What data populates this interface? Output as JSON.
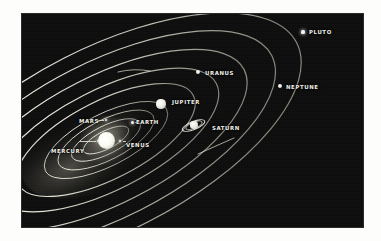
{
  "figure": {
    "kind": "solar-system-diagram",
    "caption": "",
    "background_color": "#0c0c0c",
    "page_color": "#fdfdfc",
    "label_color": "#efefe8",
    "orbit_color": "#e8e8dc",
    "plate": {
      "x": 22,
      "y": 14,
      "width": 341,
      "height": 213
    }
  },
  "sun": {
    "label": "",
    "cx": 84,
    "cy": 126,
    "r": 8.5,
    "glow_r": 26
  },
  "planets": [
    {
      "name": "MERCURY",
      "label": "MERCURY",
      "label_x": 29,
      "label_y": 135,
      "dot_x": 76,
      "dot_y": 127,
      "dot_r": 1.2,
      "orbit": {
        "rx": 25,
        "ry": 9,
        "rot": -27,
        "cx": 84,
        "cy": 126
      },
      "leader": true
    },
    {
      "name": "VENUS",
      "label": "VENUS",
      "label_x": 104,
      "label_y": 129,
      "dot_x": 98,
      "dot_y": 127,
      "dot_r": 1.4,
      "orbit": {
        "rx": 38,
        "ry": 14,
        "rot": -27,
        "cx": 84,
        "cy": 126
      },
      "leader": true
    },
    {
      "name": "EARTH",
      "label": "EARTH",
      "label_x": 114,
      "label_y": 106,
      "dot_x": 110,
      "dot_y": 108,
      "dot_r": 1.5,
      "orbit": {
        "rx": 53,
        "ry": 20,
        "rot": -27,
        "cx": 84,
        "cy": 126
      },
      "leader": true
    },
    {
      "name": "MARS",
      "label": "MARS",
      "label_x": 57,
      "label_y": 105,
      "dot_x": 84,
      "dot_y": 106,
      "dot_r": 1.3,
      "orbit": {
        "rx": 68,
        "ry": 26,
        "rot": -27,
        "cx": 84,
        "cy": 126
      },
      "leader": true
    },
    {
      "name": "JUPITER",
      "label": "JUPITER",
      "label_x": 150,
      "label_y": 86,
      "dot_x": 139,
      "dot_y": 90,
      "dot_r": 4.6,
      "orbit": {
        "rx": 98,
        "ry": 39,
        "rot": -27,
        "cx": 84,
        "cy": 126
      },
      "leader": false
    },
    {
      "name": "SATURN",
      "label": "SATURN",
      "label_x": 190,
      "label_y": 112,
      "dot_x": 172,
      "dot_y": 111,
      "dot_r": 3.6,
      "orbit": {
        "rx": 124,
        "ry": 50,
        "rot": -27,
        "cx": 84,
        "cy": 126
      },
      "leader": false,
      "has_rings": true
    },
    {
      "name": "URANUS",
      "label": "URANUS",
      "label_x": 183,
      "label_y": 57,
      "dot_x": 176,
      "dot_y": 58,
      "dot_r": 2.4,
      "orbit": {
        "rx": 155,
        "ry": 64,
        "rot": -27,
        "cx": 84,
        "cy": 126
      },
      "leader": false
    },
    {
      "name": "NEPTUNE",
      "label": "NEPTUNE",
      "label_x": 264,
      "label_y": 71,
      "dot_x": 258,
      "dot_y": 72,
      "dot_r": 2.2,
      "orbit": {
        "rx": 186,
        "ry": 78,
        "rot": -27,
        "cx": 84,
        "cy": 126
      },
      "leader": false
    },
    {
      "name": "PLUTO",
      "label": "PLUTO",
      "label_x": 287,
      "label_y": 16,
      "dot_x": 281,
      "dot_y": 18,
      "dot_r": 1.6,
      "orbit": {
        "rx": 214,
        "ry": 92,
        "rot": -27,
        "cx": 84,
        "cy": 126
      },
      "leader": false
    }
  ]
}
